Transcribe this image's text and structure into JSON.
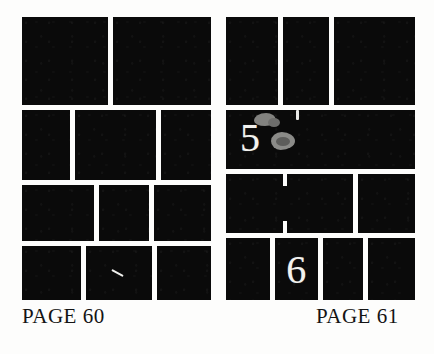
{
  "document": {
    "title": "Page layout thumbnails spread",
    "background_color": "#fdfdfc",
    "block_color": "#0a0a0a",
    "gutter_color": "#fdfdfc",
    "numeral_color": "#f2f2ef",
    "blob_color": "#82827f"
  },
  "pages": [
    {
      "id": "page-left",
      "caption": "PAGE 60",
      "rows": [
        {
          "cells": [
            {
              "flex": 47
            },
            {
              "flex": 53
            }
          ]
        },
        {
          "cells": [
            {
              "flex": 27
            },
            {
              "flex": 45
            },
            {
              "flex": 28
            }
          ]
        },
        {
          "cells": [
            {
              "flex": 40
            },
            {
              "flex": 28
            },
            {
              "flex": 32
            }
          ]
        },
        {
          "cells": [
            {
              "flex": 33
            },
            {
              "flex": 37
            },
            {
              "flex": 30
            }
          ]
        }
      ],
      "row_heights": [
        33,
        26,
        21,
        20
      ],
      "marks": [
        {
          "type": "scratch",
          "row": 4,
          "cell": 2
        }
      ]
    },
    {
      "id": "page-right",
      "caption": "PAGE 61",
      "rows": [
        {
          "cells": [
            {
              "flex": 29
            },
            {
              "flex": 26
            },
            {
              "flex": 45
            }
          ]
        },
        {
          "cells": [
            {
              "flex": 100,
              "numeral": "5"
            }
          ]
        },
        {
          "cells": [
            {
              "flex": 69,
              "notches": true
            },
            {
              "flex": 31
            }
          ]
        },
        {
          "cells": [
            {
              "flex": 25
            },
            {
              "flex": 25,
              "numeral": "6"
            },
            {
              "flex": 23
            },
            {
              "flex": 27
            }
          ]
        }
      ],
      "row_heights": [
        33,
        22,
        22,
        23
      ],
      "marks": [
        {
          "type": "blob",
          "label": "gray-smudge-upper"
        },
        {
          "type": "blob",
          "label": "gray-smudge-lower"
        },
        {
          "type": "tick",
          "label": "white-tick"
        }
      ]
    }
  ],
  "numerals": {
    "five": "5",
    "six": "6"
  },
  "captions": {
    "left": "PAGE 60",
    "right": "PAGE 61"
  }
}
